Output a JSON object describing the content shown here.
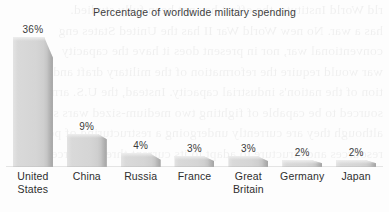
{
  "chart_data": {
    "type": "bar",
    "title": "Percentage of worldwide military spending",
    "xlabel": "",
    "ylabel": "",
    "ylim": [
      0,
      36
    ],
    "grid": false,
    "legend": "none",
    "orientation": "vertical",
    "style": "3d-bar",
    "categories": [
      "United\nStates",
      "China",
      "Russia",
      "France",
      "Great\nBritain",
      "Germany",
      "Japan"
    ],
    "values": [
      36,
      9,
      4,
      3,
      3,
      2,
      2
    ],
    "value_labels": [
      "36%",
      "9%",
      "4%",
      "3%",
      "3%",
      "2%",
      "2%"
    ],
    "unit": "%",
    "colors": {
      "bar_fill": "#d5d5d5",
      "bar_edge": "#b6b6b6",
      "bar_top": "#eeeeee",
      "text": "#2e2e2e",
      "title": "#3d3d3d",
      "background": "#fdfdfd"
    }
  },
  "page": {
    "background_bleed_text": "rld World Institute, the effort has not been fully studied.\nhas a war. No new World War II has the United States eng\nconventional war, nor in present does it have the capacity\nwar would require the reformation of the military draft and\ntion of the nation's industrial capacity. Instead, the U.S. arme\nsourced to be capable of fighting two medium-sized wars si\nalthough they are currently undergoing a restructuring of per\nresources and structure to adapt to its current threats. Forces\n"
  }
}
